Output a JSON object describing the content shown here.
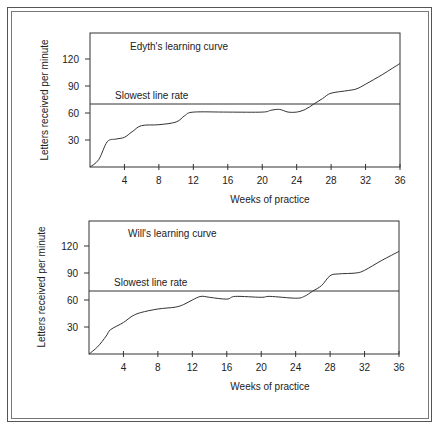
{
  "chart_data": [
    {
      "type": "line",
      "title": "Edyth's learning curve",
      "xlabel": "Weeks of practice",
      "ylabel": "Letters received per minute",
      "xlim": [
        0,
        36
      ],
      "ylim": [
        0,
        145
      ],
      "xticks": [
        4,
        8,
        12,
        16,
        20,
        24,
        28,
        32,
        36
      ],
      "yticks": [
        30,
        60,
        90,
        120
      ],
      "grid": false,
      "reference_line": {
        "label": "Slowest line rate",
        "value": 70
      },
      "series": [
        {
          "name": "Edyth",
          "x": [
            0,
            1,
            2,
            3,
            4,
            5,
            6,
            8,
            10,
            11,
            12,
            16,
            20,
            21,
            22,
            23,
            24,
            25,
            26,
            27,
            28,
            30,
            31,
            32,
            34,
            36
          ],
          "values": [
            0,
            8,
            28,
            31,
            33,
            40,
            46,
            47,
            50,
            57,
            61,
            61,
            61,
            63,
            64,
            61,
            61,
            64,
            70,
            76,
            82,
            85,
            87,
            92,
            103,
            115
          ]
        }
      ]
    },
    {
      "type": "line",
      "title": "Will's learning curve",
      "xlabel": "Weeks of practice",
      "ylabel": "Letters received per minute",
      "xlim": [
        0,
        36
      ],
      "ylim": [
        0,
        145
      ],
      "xticks": [
        4,
        8,
        12,
        16,
        20,
        24,
        28,
        32,
        36
      ],
      "yticks": [
        30,
        60,
        90,
        120
      ],
      "grid": false,
      "reference_line": {
        "label": "Slowest line rate",
        "value": 70
      },
      "series": [
        {
          "name": "Will",
          "x": [
            0,
            1,
            2,
            2.5,
            4,
            5,
            6,
            8,
            10,
            11,
            12,
            13,
            14,
            16,
            17,
            20,
            21,
            24,
            25,
            26,
            27,
            28,
            29,
            31,
            32,
            34,
            36
          ],
          "values": [
            0,
            8,
            20,
            27,
            35,
            42,
            46,
            50,
            52,
            55,
            60,
            64,
            63,
            61,
            64,
            63,
            64,
            62,
            64,
            70,
            76,
            87,
            89,
            90,
            93,
            104,
            114
          ]
        }
      ]
    }
  ],
  "colors": {
    "line": "#333333",
    "axis": "#333333",
    "text": "#222222"
  }
}
